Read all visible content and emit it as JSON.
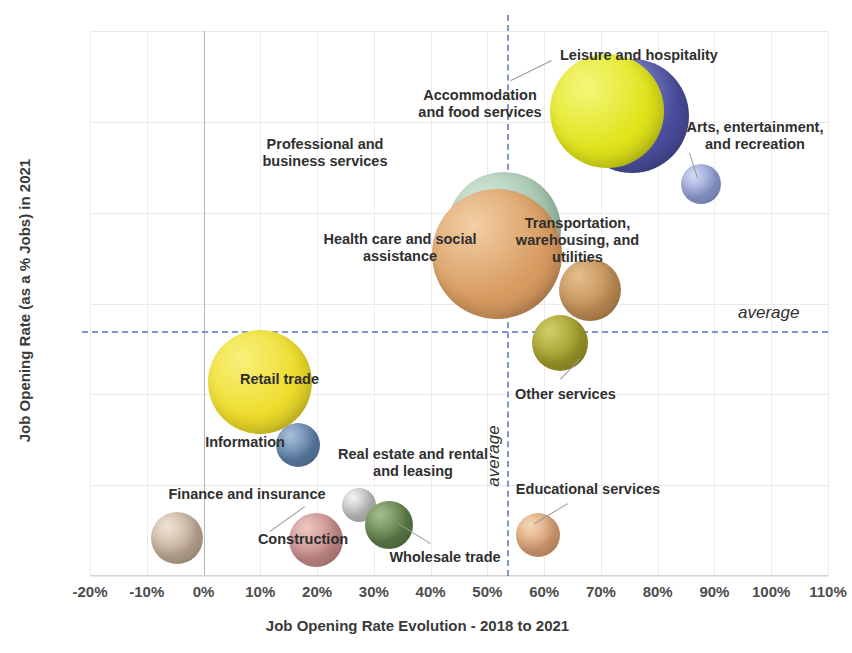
{
  "chart_data": {
    "type": "scatter",
    "subtype": "bubble",
    "title": "",
    "xlabel": "Job Opening Rate Evolution - 2018 to 2021",
    "ylabel": "Job Opening Rate (as a % Jobs) in 2021",
    "xlim": [
      -20,
      110
    ],
    "ylim": [
      4,
      10
    ],
    "xticks": [
      "-20%",
      "-10%",
      "0%",
      "10%",
      "20%",
      "30%",
      "40%",
      "50%",
      "60%",
      "70%",
      "80%",
      "90%",
      "100%",
      "110%"
    ],
    "xtick_values": [
      -20,
      -10,
      0,
      10,
      20,
      30,
      40,
      50,
      60,
      70,
      80,
      90,
      100,
      110
    ],
    "yticks": [
      "4%",
      "5%",
      "6%",
      "7%",
      "8%",
      "9%",
      "10%"
    ],
    "ytick_values": [
      4,
      5,
      6,
      7,
      8,
      9,
      10
    ],
    "grid": true,
    "legend": "none",
    "annotations": [
      {
        "name": "average-horizontal-label",
        "text": "average",
        "y": 6.7
      },
      {
        "name": "average-vertical-label",
        "text": "average",
        "x": 53.5
      }
    ],
    "reference_lines": [
      {
        "name": "average-y",
        "orientation": "horizontal",
        "value": 6.7,
        "color": "#8093d8",
        "style": "dashed"
      },
      {
        "name": "average-x",
        "orientation": "vertical",
        "value": 53.5,
        "color": "#8093d8",
        "style": "dashed"
      }
    ],
    "points": [
      {
        "label": "Leisure and hospitality",
        "x": 75.5,
        "y": 9.06,
        "size": 57,
        "color": "#4a4e9c",
        "highlight": "#9aa0e0"
      },
      {
        "label": "Accommodation and food services",
        "x": 71.1,
        "y": 9.12,
        "size": 57,
        "color": "#dfe319",
        "highlight": "#f4f77a"
      },
      {
        "label": "Professional and business services",
        "x": 53.0,
        "y": 7.82,
        "size": 57,
        "color": "#9fc2ab",
        "highlight": "#d7e8dc"
      },
      {
        "label": "Health care and social assistance",
        "x": 51.7,
        "y": 7.55,
        "size": 65,
        "color": "#d79a60",
        "highlight": "#f2cfa4"
      },
      {
        "label": "Transportation, warehousing, and utilities",
        "x": 68.0,
        "y": 7.15,
        "size": 31,
        "color": "#c08d54",
        "highlight": "#e5bd8c"
      },
      {
        "label": "Arts, entertainment, and recreation",
        "x": 87.6,
        "y": 8.32,
        "size": 20,
        "color": "#8f9cd4",
        "highlight": "#d3daf2"
      },
      {
        "label": "Other services",
        "x": 62.8,
        "y": 6.56,
        "size": 28,
        "color": "#9e9a28",
        "highlight": "#d2cd68"
      },
      {
        "label": "Retail trade",
        "x": 10.0,
        "y": 6.14,
        "size": 52,
        "color": "#eddc2a",
        "highlight": "#f8f07c"
      },
      {
        "label": "Information",
        "x": 16.6,
        "y": 5.44,
        "size": 22,
        "color": "#5c7fa8",
        "highlight": "#a8c0d9"
      },
      {
        "label": "Real estate and rental and leasing",
        "x": 27.3,
        "y": 4.78,
        "size": 17,
        "color": "#bfbfbf",
        "highlight": "#f2f2f2"
      },
      {
        "label": "Wholesale trade",
        "x": 32.7,
        "y": 4.56,
        "size": 24,
        "color": "#5d7c48",
        "highlight": "#a4bd8c"
      },
      {
        "label": "Construction",
        "x": 19.8,
        "y": 4.4,
        "size": 27,
        "color": "#c68b88",
        "highlight": "#ecc6c2"
      },
      {
        "label": "Finance and insurance",
        "x": -4.6,
        "y": 4.42,
        "size": 26,
        "color": "#bfa993",
        "highlight": "#f0e3d4"
      },
      {
        "label": "Educational services",
        "x": 59.0,
        "y": 4.45,
        "size": 22,
        "color": "#d99f73",
        "highlight": "#f5d6b4"
      }
    ]
  },
  "labels": {
    "leisure_and_hospitality": "Leisure and hospitality",
    "accommodation_and_food_services": "Accommodation\nand food services",
    "professional_and_business_services": "Professional and\nbusiness services",
    "health_care_and_social_assistance": "Health care and social\nassistance",
    "transportation_warehousing_and_utilities": "Transportation,\nwarehousing, and\nutilities",
    "arts_entertainment_and_recreation": "Arts, entertainment,\nand recreation",
    "other_services": "Other services",
    "retail_trade": "Retail trade",
    "information": "Information",
    "real_estate_and_rental_and_leasing": "Real estate and rental\nand leasing",
    "wholesale_trade": "Wholesale trade",
    "construction": "Construction",
    "finance_and_insurance": "Finance and insurance",
    "educational_services": "Educational services",
    "average_h": "average",
    "average_v": "average"
  }
}
